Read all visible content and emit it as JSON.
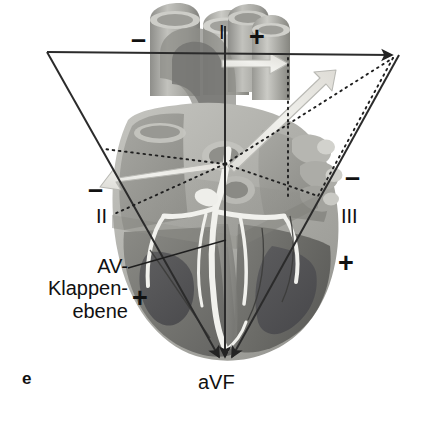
{
  "figure": {
    "panel_letter": "e",
    "caption_language": "de"
  },
  "labels": {
    "lead_i": "I",
    "lead_ii": "II",
    "lead_iii": "III",
    "lead_avf": "aVF",
    "minus_lead_i": "–",
    "plus_lead_i": "+",
    "minus_lead_ii": "–",
    "plus_lead_ii": "+",
    "minus_lead_iii": "–",
    "plus_lead_iii": "+",
    "av_plane_line1": "AV-",
    "av_plane_line2": "Klappen-",
    "av_plane_line3": "ebene"
  },
  "colors": {
    "ink": "#1a1a1a",
    "axis_line": "#2b2b2b",
    "dotted_line": "#1f1f1f",
    "pale_arrow": "#e9e9e6",
    "pale_arrow_edge": "#b9b9b4",
    "heart_outer": "#b7b7b2",
    "heart_mid": "#9a9a95",
    "heart_dark": "#6f6f6b",
    "heart_darkest": "#57575a",
    "vessel_light": "#c8c8c4",
    "conduction": "#f2f2ee",
    "background": "#ffffff"
  },
  "geometry": {
    "triangle_left_vertex": [
      47,
      52
    ],
    "triangle_right_vertex": [
      399,
      55
    ],
    "triangle_apex_bottom": [
      225,
      366
    ],
    "heart_center": [
      225,
      164
    ],
    "lead_i_axis_y": 54,
    "avf_axis_x": 225
  }
}
